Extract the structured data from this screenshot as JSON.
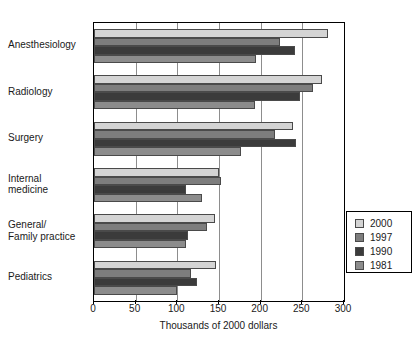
{
  "figure": {
    "top_clipped_caption": "",
    "background": "#ffffff"
  },
  "chart_data": {
    "type": "bar",
    "orientation": "horizontal",
    "title": "",
    "xlabel": "Thousands of 2000 dollars",
    "ylabel": "",
    "xlim": [
      0,
      300
    ],
    "xticks": [
      0,
      50,
      100,
      150,
      200,
      250,
      300
    ],
    "xticklabels": [
      "0",
      "50",
      "100",
      "150",
      "200",
      "250",
      "300"
    ],
    "grid": "vertical gridlines at each x tick",
    "legend_position": "center-right inside axes",
    "categories": [
      "Anesthesiology",
      "Radiology",
      "Surgery",
      "Internal medicine",
      "General/ Family practice",
      "Pediatrics"
    ],
    "category_lines": [
      [
        "Anesthesiology"
      ],
      [
        "Radiology"
      ],
      [
        "Surgery"
      ],
      [
        "Internal",
        "medicine"
      ],
      [
        "General/",
        "Family practice"
      ],
      [
        "Pediatrics"
      ]
    ],
    "series": [
      {
        "name": "2000",
        "color": "#d4d4d4",
        "values": [
          281,
          274,
          239,
          150,
          145,
          146
        ]
      },
      {
        "name": "1997",
        "color": "#7d7d7d",
        "values": [
          223,
          263,
          217,
          152,
          136,
          116
        ]
      },
      {
        "name": "1990",
        "color": "#3b3b3b",
        "values": [
          241,
          247,
          242,
          110,
          113,
          123
        ]
      },
      {
        "name": "1981",
        "color": "#8c8c8c",
        "values": [
          194,
          193,
          176,
          130,
          110,
          100
        ]
      }
    ]
  },
  "legend": {
    "entries": [
      {
        "label": "2000",
        "color": "#d4d4d4"
      },
      {
        "label": "1997",
        "color": "#7d7d7d"
      },
      {
        "label": "1990",
        "color": "#3b3b3b"
      },
      {
        "label": "1981",
        "color": "#8c8c8c"
      }
    ]
  }
}
